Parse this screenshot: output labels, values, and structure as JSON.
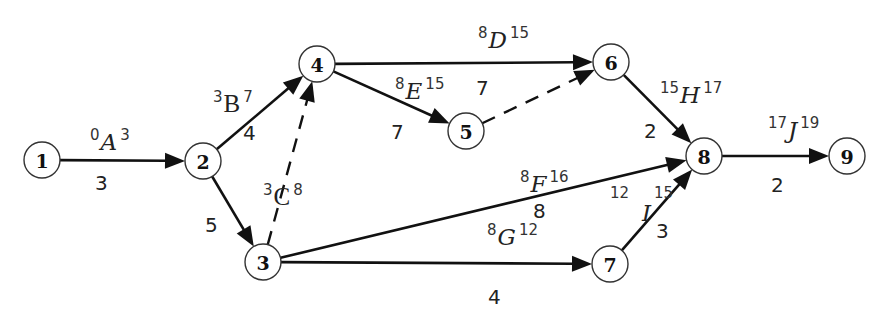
{
  "diagram": {
    "type": "activity-on-arrow network (CPM)",
    "nodes": [
      {
        "id": "1",
        "x": 42,
        "y": 160
      },
      {
        "id": "2",
        "x": 203,
        "y": 161
      },
      {
        "id": "3",
        "x": 263,
        "y": 262
      },
      {
        "id": "4",
        "x": 317,
        "y": 64
      },
      {
        "id": "5",
        "x": 466,
        "y": 131
      },
      {
        "id": "6",
        "x": 611,
        "y": 62
      },
      {
        "id": "7",
        "x": 610,
        "y": 264
      },
      {
        "id": "8",
        "x": 704,
        "y": 156
      },
      {
        "id": "9",
        "x": 847,
        "y": 156
      }
    ],
    "activities": [
      {
        "name": "A",
        "from": "1",
        "to": "2",
        "duration": "3",
        "es": "0",
        "ef": "3"
      },
      {
        "name": "B",
        "from": "2",
        "to": "4",
        "duration": "4",
        "es": "3",
        "ef": "7"
      },
      {
        "name": "C",
        "from": "2",
        "to": "3",
        "duration": "5",
        "es": "3",
        "ef": "8"
      },
      {
        "name": "D",
        "from": "4",
        "to": "6",
        "duration": "7",
        "es": "8",
        "ef": "15"
      },
      {
        "name": "E",
        "from": "4",
        "to": "5",
        "duration": "7",
        "es": "8",
        "ef": "15"
      },
      {
        "name": "F",
        "from": "3",
        "to": "8",
        "duration": "8",
        "es": "8",
        "ef": "16"
      },
      {
        "name": "G",
        "from": "3",
        "to": "7",
        "duration": "4",
        "es": "8",
        "ef": "12"
      },
      {
        "name": "H",
        "from": "6",
        "to": "8",
        "duration": "2",
        "es": "15",
        "ef": "17"
      },
      {
        "name": "I",
        "from": "7",
        "to": "8",
        "duration": "3",
        "es": "12",
        "ef": "15"
      },
      {
        "name": "J",
        "from": "8",
        "to": "9",
        "duration": "2",
        "es": "17",
        "ef": "19"
      }
    ],
    "dummies": [
      {
        "from": "3",
        "to": "4"
      },
      {
        "from": "5",
        "to": "6"
      }
    ]
  }
}
